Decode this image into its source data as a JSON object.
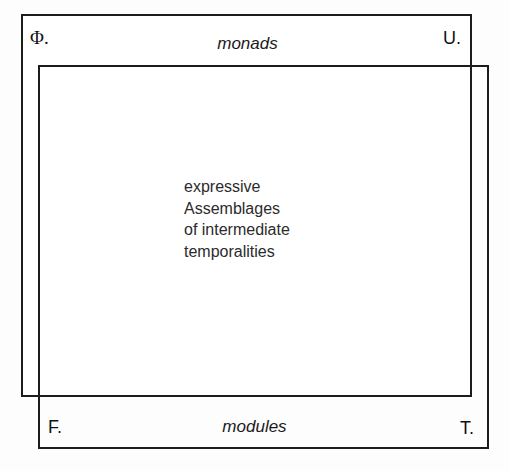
{
  "diagram": {
    "title": "expressive Assemblages of intermediate temporalities",
    "background_color": "#fdfdfd",
    "line_color": "#1c1c1c",
    "text_color": "#2b2b2b",
    "rectangles": [
      {
        "name": "upper-left-rectangle",
        "corners": [
          "Φ.",
          "U.",
          "F."
        ]
      },
      {
        "name": "lower-right-rectangle",
        "corners": [
          "F.",
          "T."
        ]
      }
    ],
    "corner_labels": {
      "top_left": "Φ.",
      "top_right": "U.",
      "bottom_left": "F.",
      "bottom_right": "T."
    },
    "edge_labels": {
      "top": "monads",
      "bottom": "modules"
    },
    "center_text": {
      "lines": [
        "expressive",
        "Assemblages",
        "of intermediate",
        "temporalities"
      ]
    }
  }
}
